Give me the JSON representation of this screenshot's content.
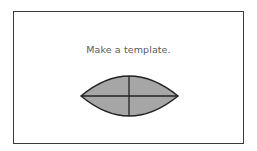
{
  "caption": "Make a template.",
  "shape": {
    "type": "lens",
    "fill": "#a6a6a6",
    "stroke": "#222222",
    "left_tip": [
      81,
      96
    ],
    "right_tip": [
      178,
      96
    ],
    "top_y": 76,
    "bottom_y": 116,
    "center_x": 129
  }
}
